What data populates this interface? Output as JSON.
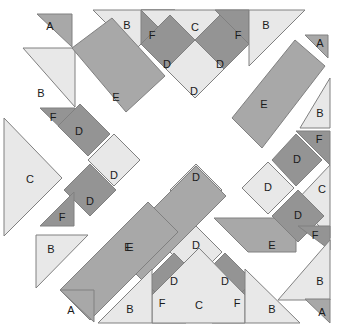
{
  "figure": {
    "width": 342,
    "height": 333,
    "background": "#ffffff",
    "stroke_color": "#808080",
    "symmetry": "4-fold rotational, block rotated 45 degrees"
  },
  "palette": {
    "light": "#e8e8e8",
    "medium": "#a8a8a8",
    "dark": "#949494",
    "stroke": "#808080",
    "background": "#ffffff",
    "label_color": "#1a1a1a"
  },
  "legend": {
    "piece_types": [
      {
        "key": "A",
        "label": "A",
        "description": "small corner triangle",
        "shade": "medium"
      },
      {
        "key": "B",
        "label": "B",
        "description": "light edge triangle",
        "shade": "light"
      },
      {
        "key": "C",
        "label": "C",
        "description": "large light triangle",
        "shade": "light"
      },
      {
        "key": "D",
        "label": "D",
        "description": "square on point",
        "shade": "dark or light"
      },
      {
        "key": "E",
        "label": "E",
        "description": "long diagonal bar",
        "shade": "medium"
      },
      {
        "key": "F",
        "label": "F",
        "description": "small dark triangle",
        "shade": "dark"
      }
    ]
  },
  "pieces": [
    {
      "name": "piece-a-top-left",
      "label": "A",
      "shade": "medium",
      "points": "37,14 72,14 72,47",
      "lx": 50,
      "ly": 27
    },
    {
      "name": "piece-b-top-left",
      "label": "B",
      "shade": "light",
      "points": "93,10 175,10 134,51",
      "lx": 127,
      "ly": 26
    },
    {
      "name": "piece-f-top-left",
      "label": "F",
      "shade": "dark",
      "points": "141,10 175,10 141,44",
      "lx": 152,
      "ly": 36
    },
    {
      "name": "piece-c-top",
      "label": "C",
      "shade": "light",
      "points": "141,10 249,10 195,64",
      "lx": 195,
      "ly": 28
    },
    {
      "name": "piece-f-top-right",
      "label": "F",
      "shade": "dark",
      "points": "215,10 249,10 249,44",
      "lx": 238,
      "ly": 36
    },
    {
      "name": "piece-b-top-right",
      "label": "B",
      "shade": "light",
      "points": "249,10 305,10 249,66",
      "lx": 266,
      "ly": 26
    },
    {
      "name": "piece-d-top-left-dark",
      "label": "D",
      "shade": "dark",
      "points": "141,44 170,15 199,44 170,73",
      "lx": 167,
      "ly": 65
    },
    {
      "name": "piece-d-top-right-dark",
      "label": "D",
      "shade": "dark",
      "points": "191,44 220,15 249,44 220,73",
      "lx": 220,
      "ly": 65
    },
    {
      "name": "piece-d-top-center-light",
      "label": "D",
      "shade": "light",
      "points": "166,69 195,40 224,69 195,98",
      "lx": 194,
      "ly": 92
    },
    {
      "name": "piece-a-top-right",
      "label": "A",
      "shade": "medium",
      "points": "305,35 328,35 328,58",
      "lx": 320,
      "ly": 44
    },
    {
      "name": "piece-b-left-upper",
      "label": "B",
      "shade": "light",
      "points": "23,48 75,48 75,107",
      "lx": 41,
      "ly": 94
    },
    {
      "name": "piece-e-upper-left",
      "label": "E",
      "shade": "medium",
      "points": "72,48 112,18 165,76 126,112",
      "lx": 116,
      "ly": 98
    },
    {
      "name": "piece-f-left-mid",
      "label": "F",
      "shade": "dark",
      "points": "40,108 75,108 75,142",
      "lx": 53,
      "ly": 118
    },
    {
      "name": "piece-d-left-upper-dark",
      "label": "D",
      "shade": "dark",
      "points": "58,126 80,104 110,134 88,156",
      "lx": 79,
      "ly": 132
    },
    {
      "name": "piece-c-left",
      "label": "C",
      "shade": "light",
      "points": "4,118 62,178 4,236",
      "lx": 30,
      "ly": 180
    },
    {
      "name": "piece-e-upper-right",
      "label": "E",
      "shade": "medium",
      "points": "232,118 295,40 325,66 262,148",
      "lx": 264,
      "ly": 105
    },
    {
      "name": "piece-b-right-upper",
      "label": "B",
      "shade": "light",
      "points": "330,78 330,128 300,128",
      "lx": 320,
      "ly": 114
    },
    {
      "name": "piece-f-right-upper",
      "label": "F",
      "shade": "dark",
      "points": "296,131 330,131 330,165",
      "lx": 319,
      "ly": 140
    },
    {
      "name": "piece-d-right-upper-dark",
      "label": "D",
      "shade": "dark",
      "points": "272,160 296,134 322,160 296,186",
      "lx": 297,
      "ly": 160
    },
    {
      "name": "piece-d-right-light",
      "label": "D",
      "shade": "light",
      "points": "242,188 268,162 294,188 268,214",
      "lx": 268,
      "ly": 188
    },
    {
      "name": "piece-c-right",
      "label": "C",
      "shade": "light",
      "points": "330,165 330,238 296,201",
      "lx": 322,
      "ly": 190
    },
    {
      "name": "piece-d-left-lower-light",
      "label": "D",
      "shade": "light",
      "points": "88,160 114,134 140,160 114,186",
      "lx": 114,
      "ly": 176
    },
    {
      "name": "piece-d-center-left-dark",
      "label": "D",
      "shade": "dark",
      "points": "64,190 90,164 116,190 90,216",
      "lx": 90,
      "ly": 202
    },
    {
      "name": "piece-f-left-lower",
      "label": "F",
      "shade": "dark",
      "points": "40,226 74,226 74,192",
      "lx": 62,
      "ly": 218
    },
    {
      "name": "piece-d-center-upper",
      "label": "D",
      "shade": "light",
      "points": "170,190 196,164 222,190 196,216",
      "lx": 196,
      "ly": 178
    },
    {
      "name": "piece-e-center",
      "label": "E",
      "shade": "medium",
      "points": "112,250 196,166 226,196 142,280",
      "lx": 130,
      "ly": 248
    },
    {
      "name": "piece-e-right-lower",
      "label": "E",
      "shade": "medium",
      "points": "214,218 296,218 296,252 248,252",
      "lx": 272,
      "ly": 246
    },
    {
      "name": "piece-d-right-lower-dark",
      "label": "D",
      "shade": "dark",
      "points": "272,216 298,190 324,216 298,242",
      "lx": 298,
      "ly": 216
    },
    {
      "name": "piece-f-right-lower",
      "label": "F",
      "shade": "dark",
      "points": "298,226 330,226 330,250",
      "lx": 315,
      "ly": 236
    },
    {
      "name": "piece-b-right-lower",
      "label": "B",
      "shade": "light",
      "points": "330,240 330,300 278,300",
      "lx": 320,
      "ly": 282
    },
    {
      "name": "piece-b-left-lower",
      "label": "B",
      "shade": "light",
      "points": "36,235 88,235 36,288",
      "lx": 51,
      "ly": 250
    },
    {
      "name": "piece-d-bottom-center-light",
      "label": "D",
      "shade": "light",
      "points": "170,252 196,226 222,252 196,278",
      "lx": 196,
      "ly": 246
    },
    {
      "name": "piece-d-bottom-left-dark",
      "label": "D",
      "shade": "dark",
      "points": "145,282 174,253 203,282 174,311",
      "lx": 174,
      "ly": 282
    },
    {
      "name": "piece-d-bottom-right-dark",
      "label": "D",
      "shade": "dark",
      "points": "196,282 225,253 254,282 225,311",
      "lx": 225,
      "ly": 282
    },
    {
      "name": "piece-f-bottom-left",
      "label": "F",
      "shade": "dark",
      "points": "152,289 152,323 186,323",
      "lx": 162,
      "ly": 304
    },
    {
      "name": "piece-f-bottom-right",
      "label": "F",
      "shade": "dark",
      "points": "245,289 245,323 212,323",
      "lx": 237,
      "ly": 304
    },
    {
      "name": "piece-c-bottom",
      "label": "C",
      "shade": "light",
      "points": "152,295 199,248 245,295 245,323 152,323",
      "lx": 199,
      "ly": 306
    },
    {
      "name": "piece-b-bottom-left",
      "label": "B",
      "shade": "light",
      "points": "98,323 152,269 152,323",
      "lx": 130,
      "ly": 310
    },
    {
      "name": "piece-b-bottom-right",
      "label": "B",
      "shade": "light",
      "points": "245,269 300,323 245,323",
      "lx": 272,
      "ly": 310
    },
    {
      "name": "piece-e-lower-left",
      "label": "E",
      "shade": "medium",
      "points": "60,290 148,202 178,232 90,320",
      "lx": 128,
      "ly": 248
    },
    {
      "name": "piece-a-bottom-left",
      "label": "A",
      "shade": "medium",
      "points": "60,290 94,290 94,322",
      "lx": 71,
      "ly": 311
    },
    {
      "name": "piece-a-bottom-right",
      "label": "A",
      "shade": "medium",
      "points": "305,299 330,299 330,323",
      "lx": 322,
      "ly": 313
    }
  ]
}
